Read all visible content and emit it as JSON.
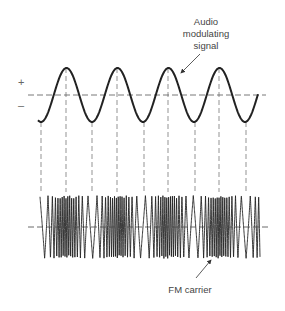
{
  "figure": {
    "labels": {
      "audio_line1": "Audio",
      "audio_line2": "modulating",
      "audio_line3": "signal",
      "plus": "+",
      "minus": "–",
      "carrier": "FM carrier"
    },
    "colors": {
      "ink": "#222222",
      "dash": "#555555",
      "background": "#ffffff"
    },
    "audio_signal": {
      "axis_y": 95,
      "amplitude": 27,
      "period_px": 51,
      "x_start": 38,
      "x_end": 258,
      "crest_x": [
        66,
        117,
        168,
        219
      ],
      "trough_x": [
        41,
        92,
        144,
        195,
        246
      ]
    },
    "fm_carrier": {
      "x_start": 40,
      "x_end": 260,
      "y_top": 195,
      "y_bottom": 258,
      "center_y": 227,
      "dense_at": "troughs of audio signal",
      "sparse_at": "crests of audio signal"
    }
  }
}
